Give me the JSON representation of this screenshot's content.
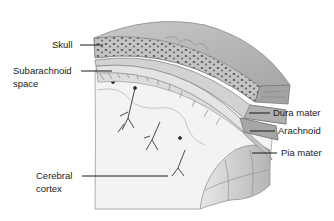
{
  "figure": {
    "labels": {
      "skull": "Skull",
      "subarachnoid_line1": "Subarachnoid",
      "subarachnoid_line2": "space",
      "dura_mater": "Dura mater",
      "arachnoid": "Arachnoid",
      "pia_mater": "Pia mater",
      "cerebral_line1": "Cerebral",
      "cerebral_line2": "cortex"
    },
    "colors": {
      "background": "#ffffff",
      "skull_surface": "#b8b8b8",
      "skull_bone": "#8c8c8c",
      "membrane_light": "#d9d9d9",
      "membrane_mid": "#a8a8a8",
      "cortex": "#f2f2f2",
      "text": "#1a1a1a"
    }
  }
}
